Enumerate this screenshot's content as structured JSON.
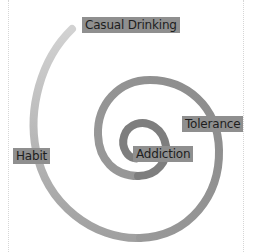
{
  "diagram": {
    "type": "spiral",
    "stages": [
      {
        "id": "casual",
        "label": "Casual Drinking"
      },
      {
        "id": "habit",
        "label": "Habit"
      },
      {
        "id": "tolerance",
        "label": "Tolerance"
      },
      {
        "id": "addiction",
        "label": "Addiction"
      }
    ],
    "colors": {
      "spiral_start": "#cdcdcd",
      "spiral_mid": "#9a9a9a",
      "spiral_end": "#7a7a7a",
      "label_bg": "#8f8f8f",
      "label_text": "#1e1e1e",
      "guide_line": "#d6d6d6"
    }
  }
}
